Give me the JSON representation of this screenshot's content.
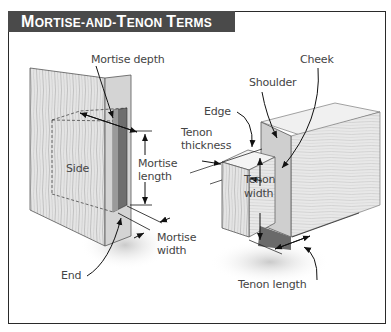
{
  "title": "Mortise-and-Tenon Terms",
  "title_parts": [
    {
      "text": "M",
      "big": true
    },
    {
      "text": "ORTISE-AND-",
      "big": false
    },
    {
      "text": "T",
      "big": true
    },
    {
      "text": "ENON ",
      "big": false
    },
    {
      "text": "T",
      "big": true
    },
    {
      "text": "ERMS",
      "big": false
    }
  ],
  "colors": {
    "header_bg": "#4a4a4a",
    "header_text": "#ffffff",
    "border": "#2a2a2a",
    "wood": "#d8d8d8",
    "wood_dark": "#8a8a8a",
    "label": "#444444"
  },
  "mortise_labels": {
    "depth": "Mortise depth",
    "side": "Side",
    "length_1": "Mortise",
    "length_2": "length",
    "width_1": "Mortise",
    "width_2": "width",
    "end": "End"
  },
  "tenon_labels": {
    "cheek": "Cheek",
    "shoulder": "Shoulder",
    "edge": "Edge",
    "thickness_1": "Tenon",
    "thickness_2": "thickness",
    "width_1": "Tenon",
    "width_2": "width",
    "length": "Tenon length"
  }
}
